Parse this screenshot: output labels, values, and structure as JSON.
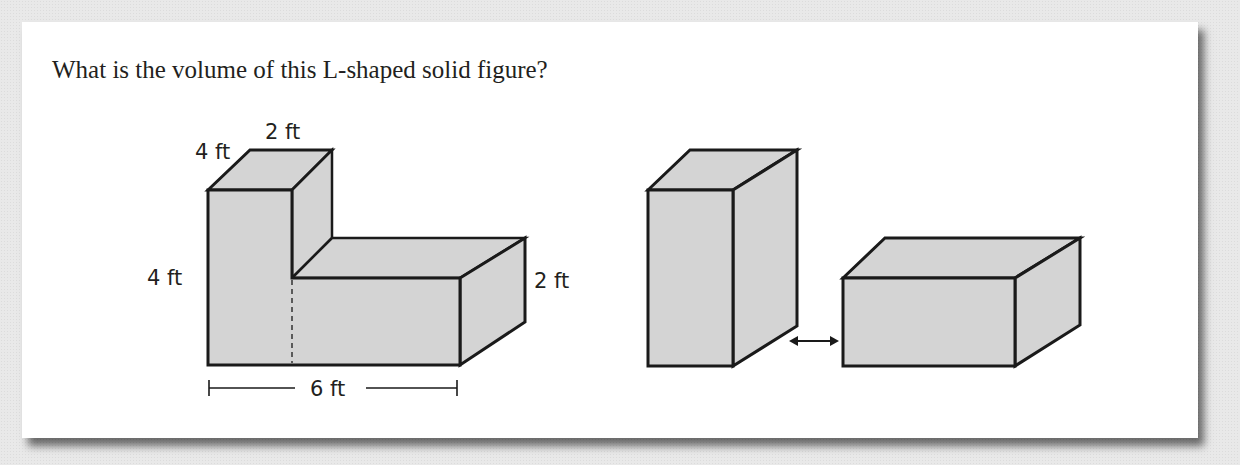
{
  "question": {
    "text": "What is the volume of this L-shaped solid figure?"
  },
  "figures": {
    "l_shape": {
      "labels": {
        "depth_top": "4 ft",
        "width_top": "2 ft",
        "height_left": "4 ft",
        "height_right": "2 ft",
        "length_bottom": "6 ft"
      }
    },
    "decomposition": {
      "parts": [
        "tall-prism",
        "wide-prism"
      ],
      "separator": "double-arrow"
    }
  },
  "colors": {
    "face_fill": "#d4d4d4",
    "stroke": "#1a1a1a",
    "card": "#ffffff"
  }
}
